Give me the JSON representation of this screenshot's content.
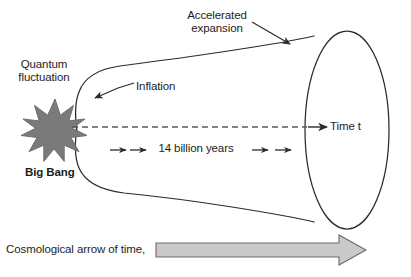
{
  "diagram": {
    "title_visible": false,
    "labels": {
      "quantum_fluctuation": "Quantum\nfluctuation",
      "quantum_fluctuation_line1": "Quantum",
      "quantum_fluctuation_line2": "fluctuation",
      "accelerated_expansion_line1": "Accelerated",
      "accelerated_expansion_line2": "expansion",
      "inflation": "Inflation",
      "big_bang": "Big Bang",
      "duration": "14 billion years",
      "time_axis": "Time t",
      "arrow_of_time": "Cosmological arrow of time,"
    },
    "colors": {
      "outline": "#2b2b2b",
      "text": "#1d1d1d",
      "starburst_fill": "#7a7a7a",
      "starburst_stroke": "#6e6e6e",
      "dashed_axis": "#5a5a5a",
      "block_arrow_fill": "#c9c9c9",
      "block_arrow_stroke": "#6a6a6a",
      "background": "#ffffff"
    },
    "elements": {
      "starburst_points": 12,
      "funnel_shape": "expanding cone from Big Bang singularity to present-day ellipse",
      "end_cap": "ellipse",
      "time_axis_style": "dashed with solid arrowhead",
      "duration_markers": 4
    }
  }
}
